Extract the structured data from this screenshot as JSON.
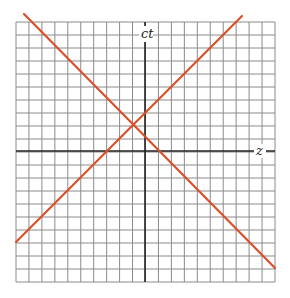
{
  "diagram": {
    "type": "spacetime-diagram",
    "axes": {
      "vertical_label": "ct",
      "horizontal_label": "z"
    },
    "grid": {
      "left": 16,
      "top": 22,
      "right": 275,
      "bottom": 282,
      "columns": 20,
      "rows": 20,
      "line_color": "#8a8a8a",
      "axis_color": "#222222"
    },
    "origin_px": {
      "x": 145,
      "y": 151
    },
    "light_lines": [
      {
        "name": "left-moving-light-ray",
        "x1": 24,
        "y1": 14,
        "x2": 275,
        "y2": 268,
        "color": "#d9502a"
      },
      {
        "name": "right-moving-light-ray",
        "x1": 16,
        "y1": 242,
        "x2": 242,
        "y2": 16,
        "color": "#d9502a"
      }
    ]
  }
}
